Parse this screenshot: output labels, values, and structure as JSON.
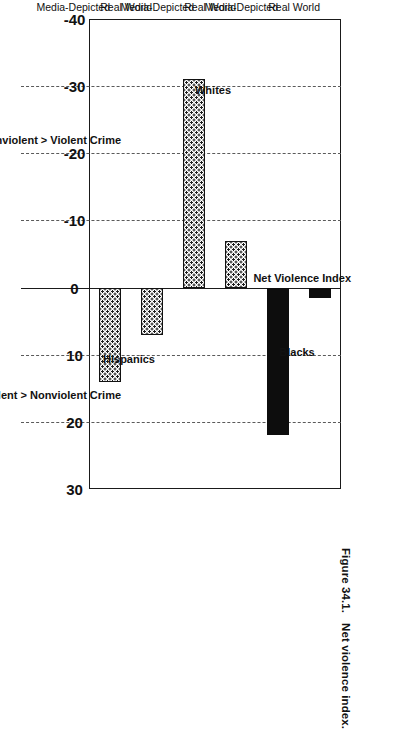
{
  "figure": {
    "number": "Figure 34.1.",
    "caption": "Net violence index."
  },
  "chart_data": {
    "type": "bar",
    "title": "",
    "value_axis_label": "Net Violence Index",
    "orientation": "horizontal-rotated-page",
    "categories": [
      "Real World",
      "Media-Depicted",
      "Real World",
      "Media-Depicted",
      "Real World",
      "Media-Depicted"
    ],
    "group_labels": [
      "Blacks",
      "Whites",
      "Hispanics"
    ],
    "groups": [
      {
        "name": "Blacks",
        "points": [
          {
            "category": "Real World",
            "value": 1.5,
            "fill": "solid-black"
          },
          {
            "category": "Media-Depicted",
            "value": 22,
            "fill": "solid-black"
          }
        ]
      },
      {
        "name": "Whites",
        "points": [
          {
            "category": "Real World",
            "value": -7,
            "fill": "checker-hatch"
          },
          {
            "category": "Media-Depicted",
            "value": -31,
            "fill": "checker-hatch"
          }
        ]
      },
      {
        "name": "Hispanics",
        "points": [
          {
            "category": "Real World",
            "value": 7,
            "fill": "checker-hatch"
          },
          {
            "category": "Media-Depicted",
            "value": 14,
            "fill": "checker-hatch"
          }
        ]
      }
    ],
    "values": [
      1.5,
      22,
      -7,
      -31,
      7,
      14
    ],
    "ticks": [
      -40,
      -30,
      -20,
      -10,
      0,
      10,
      20,
      30
    ],
    "tick_labels": [
      "-40",
      "-30",
      "-20",
      "-10",
      "0",
      "10",
      "20",
      "30"
    ],
    "xlim": [
      -40,
      30
    ],
    "grid": "dashed gridlines at -30, -20, -10, 10, 20; solid axis at 0",
    "direction_labels": {
      "negative": "Nonviolent > Violent Crime",
      "positive": "Violent > Nonviolent Crime"
    },
    "legend": "none",
    "colors": {
      "solid_bar": "#0d0d0d",
      "hatched_bar_outline": "#111111",
      "gridline": "#5a5a5a",
      "axis": "#1a1a1a",
      "background": "#ffffff"
    }
  }
}
